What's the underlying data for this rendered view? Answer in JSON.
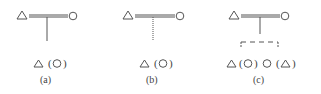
{
  "diagram": {
    "panels": [
      {
        "id": "a",
        "caption": "(a)",
        "left_symbol": "triangle",
        "right_symbol": "circle",
        "union": "double-line",
        "descent_line": "solid",
        "offspring_text": "(",
        "offspring_text_close": ")",
        "offspring": [
          {
            "symbol": "triangle",
            "alt_symbol": "circle"
          }
        ]
      },
      {
        "id": "b",
        "caption": "(b)",
        "left_symbol": "triangle",
        "right_symbol": "circle",
        "union": "double-line",
        "descent_line": "dotted",
        "offspring_text": "(",
        "offspring_text_close": ")",
        "offspring": [
          {
            "symbol": "triangle",
            "alt_symbol": "circle"
          }
        ]
      },
      {
        "id": "c",
        "caption": "(c)",
        "left_symbol": "triangle",
        "right_symbol": "circle",
        "union": "double-line",
        "descent_line": "solid",
        "sibling_bar": "dashed",
        "offspring_text": "(",
        "offspring_text_close": ")",
        "offspring": [
          {
            "symbol": "triangle",
            "alt_symbol": "circle"
          },
          {
            "symbol": "circle",
            "alt_symbol": "triangle"
          }
        ]
      }
    ],
    "colors": {
      "stroke": "#555555",
      "text": "#444444",
      "background": "#ffffff"
    }
  }
}
